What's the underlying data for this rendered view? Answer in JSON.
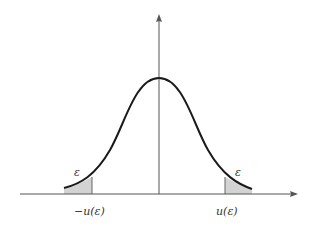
{
  "diagram": {
    "type": "normal-distribution-two-tailed",
    "curve": "bell curve (standard normal density)",
    "tails": {
      "left": {
        "area_label": "ε",
        "bound_label": "−u(ε)"
      },
      "right": {
        "area_label": "ε",
        "bound_label": "u(ε)"
      }
    },
    "colors": {
      "curve": "#1a1a1a",
      "axis": "#555555",
      "shade": "#d3d3d3"
    }
  }
}
